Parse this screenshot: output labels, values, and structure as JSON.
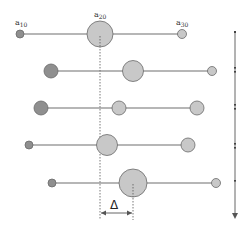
{
  "labels": {
    "a10": {
      "base": "a",
      "sub": "10"
    },
    "a20": {
      "base": "a",
      "sub": "20"
    },
    "a30": {
      "base": "a",
      "sub": "30"
    },
    "delta": "Δ"
  },
  "colors": {
    "line": "#6e6e6e",
    "circle_fill_light": "#c8c8c8",
    "circle_fill_dark": "#8f8f8f",
    "circle_stroke": "#6a6a6a",
    "dashed": "#555555",
    "arrow": "#555555"
  },
  "rows": [
    {
      "y": 34,
      "circles": [
        {
          "x": 20,
          "r": 4,
          "tone": "dark"
        },
        {
          "x": 100,
          "r": 13,
          "tone": "light"
        },
        {
          "x": 182,
          "r": 4.5,
          "tone": "light"
        }
      ]
    },
    {
      "y": 71,
      "circles": [
        {
          "x": 51,
          "r": 7,
          "tone": "dark"
        },
        {
          "x": 133,
          "r": 10.5,
          "tone": "light"
        },
        {
          "x": 212,
          "r": 4.5,
          "tone": "light"
        }
      ]
    },
    {
      "y": 108,
      "circles": [
        {
          "x": 41,
          "r": 7,
          "tone": "dark"
        },
        {
          "x": 119,
          "r": 7,
          "tone": "light"
        },
        {
          "x": 197,
          "r": 7,
          "tone": "light"
        }
      ]
    },
    {
      "y": 145,
      "circles": [
        {
          "x": 29,
          "r": 4,
          "tone": "dark"
        },
        {
          "x": 107,
          "r": 10.5,
          "tone": "light"
        },
        {
          "x": 188,
          "r": 7,
          "tone": "light"
        }
      ]
    },
    {
      "y": 183,
      "circles": [
        {
          "x": 52,
          "r": 4,
          "tone": "dark"
        },
        {
          "x": 133,
          "r": 14,
          "tone": "light"
        },
        {
          "x": 216,
          "r": 4.5,
          "tone": "light"
        }
      ]
    }
  ]
}
